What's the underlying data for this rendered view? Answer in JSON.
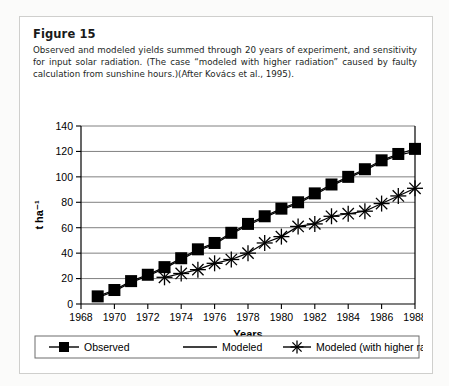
{
  "figure": {
    "title": "Figure 15"
  },
  "chart_data": {
    "type": "line",
    "title": "",
    "xlabel": "Years",
    "ylabel": "t ha⁻¹",
    "xlim": [
      1968,
      1988
    ],
    "ylim": [
      0,
      140
    ],
    "ytick_step": 20,
    "xtick_step": 2,
    "xticks": [
      "1968",
      "1970",
      "1972",
      "1974",
      "1976",
      "1978",
      "1980",
      "1982",
      "1984",
      "1986",
      "1988"
    ],
    "yticks": [
      "0",
      "20",
      "40",
      "60",
      "80",
      "100",
      "120",
      "140"
    ],
    "grid": "horizontal",
    "legend_position": "bottom",
    "x": [
      1969,
      1970,
      1971,
      1972,
      1973,
      1974,
      1975,
      1976,
      1977,
      1978,
      1979,
      1980,
      1981,
      1982,
      1983,
      1984,
      1985,
      1986,
      1987,
      1988
    ],
    "series": [
      {
        "name": "Observed",
        "marker": "square",
        "values": [
          6,
          11,
          18,
          23,
          29,
          36,
          43,
          48,
          56,
          63,
          69,
          75,
          80,
          87,
          94,
          100,
          106,
          113,
          118,
          122
        ]
      },
      {
        "name": "Modeled",
        "marker": "none",
        "values": [
          5,
          10,
          17,
          22,
          28,
          35,
          42,
          47,
          55,
          62,
          68,
          74,
          79,
          86,
          93,
          99,
          105,
          112,
          117,
          120
        ]
      },
      {
        "name": "Modeled (with higher radiation",
        "marker": "asterisk",
        "values": [
          null,
          null,
          null,
          null,
          21,
          24,
          27,
          32,
          35,
          40,
          48,
          53,
          61,
          63,
          69,
          71,
          73,
          79,
          85,
          91
        ]
      }
    ]
  },
  "legend": {
    "items": [
      {
        "label": "Observed",
        "marker": "square"
      },
      {
        "label": "Modeled",
        "marker": "line"
      },
      {
        "label": "Modeled (with higher radiation",
        "marker": "asterisk"
      }
    ]
  }
}
